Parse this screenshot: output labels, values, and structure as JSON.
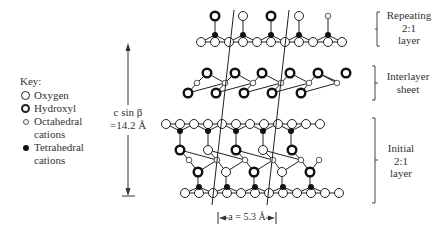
{
  "key": {
    "title": "Key:",
    "items": [
      {
        "symbol": "open-circle",
        "label": "Oxygen"
      },
      {
        "symbol": "thick-circle",
        "label": "Hydroxyl"
      },
      {
        "symbol": "small-open-circle",
        "label": "Octahedral",
        "label2": "cations"
      },
      {
        "symbol": "filled-circle",
        "label": "Tetrahedral",
        "label2": "cations"
      }
    ]
  },
  "dimension_vertical": {
    "line1": "c sin β",
    "line2": "=14.2 Å"
  },
  "dimension_horizontal": {
    "label": "a = 5.3 Å"
  },
  "brackets": {
    "repeating": {
      "line1": "Repeating",
      "line2": "2:1",
      "line3": "layer"
    },
    "interlayer": {
      "line1": "Interlayer",
      "line2": "sheet"
    },
    "initial": {
      "line1": "Initial",
      "line2": "2:1",
      "line3": "layer"
    }
  },
  "colors": {
    "stroke": "#222222",
    "text": "#333333"
  }
}
